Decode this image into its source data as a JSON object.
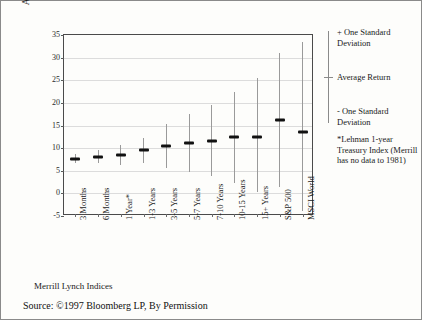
{
  "chart_data": {
    "type": "scatter",
    "title": "",
    "xlabel": "Merrill Lynch Indices",
    "ylabel": "Annualized Quarterly Return (%)",
    "ylim": [
      -5,
      35
    ],
    "yticks": [
      35,
      30,
      25,
      20,
      15,
      10,
      5,
      0,
      -5
    ],
    "grid": true,
    "legend_position": "right",
    "categories": [
      "3 Months",
      "6 Months",
      "1 Year*",
      "1-3 Years",
      "3-5 Years",
      "5-7 Years",
      "7-10 Years",
      "10-15 Years",
      "15+ Years",
      "S&P 500",
      "MSCI World"
    ],
    "series": [
      {
        "name": "Average Return",
        "values": [
          7.6,
          8.0,
          8.5,
          9.5,
          10.5,
          11.1,
          11.6,
          12.4,
          12.5,
          16.3,
          13.6
        ]
      },
      {
        "name": "+ One Standard Deviation",
        "values": [
          8.6,
          9.5,
          10.6,
          12.2,
          15.3,
          17.6,
          19.5,
          22.5,
          25.5,
          31.0,
          33.5
        ]
      },
      {
        "name": "- One Standard Deviation",
        "values": [
          6.7,
          6.6,
          6.3,
          6.7,
          5.7,
          4.8,
          3.8,
          2.3,
          0.3,
          1.5,
          -4.0
        ]
      }
    ],
    "annotations": [
      "*Lehman 1-year Treasury Index (Merrill has no data to 1981)",
      "Source: ©1997 Bloomberg LP, By Permission"
    ]
  },
  "legend": {
    "plus_sd": "+ One Standard Deviation",
    "average": "Average Return",
    "minus_sd": "- One Standard Deviation"
  },
  "footnote": {
    "text": "*Lehman 1-year Treasury Index (Merrill has no data to 1981)"
  },
  "source": {
    "text": "Source: ©1997 Bloomberg LP, By Permission"
  },
  "colors": {
    "mean_marker": "#111111",
    "whisker": "#9a9a9a",
    "gridline": "#dcdcdc",
    "frame": "#4a4a4a",
    "border": "#8a8a8a",
    "background": "#fdfdfb"
  }
}
